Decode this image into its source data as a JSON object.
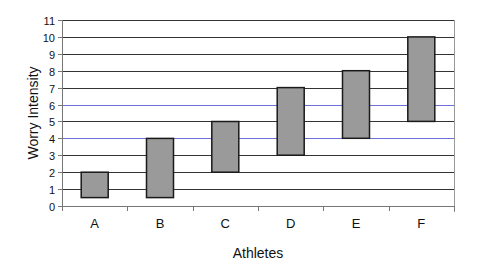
{
  "chart_data": {
    "type": "bar",
    "subtype": "floating-range",
    "title": "",
    "xlabel": "Athletes",
    "ylabel": "Worry Intensity",
    "categories": [
      "A",
      "B",
      "C",
      "D",
      "E",
      "F"
    ],
    "series": [
      {
        "name": "Low",
        "values": [
          0.5,
          0.5,
          2,
          3,
          4,
          5
        ]
      },
      {
        "name": "High",
        "values": [
          2,
          4,
          5,
          7,
          8,
          10
        ]
      }
    ],
    "ylim": [
      0,
      11
    ],
    "yticks": [
      0,
      1,
      2,
      3,
      4,
      5,
      6,
      7,
      8,
      9,
      10,
      11
    ],
    "grid": true,
    "highlighted_gridlines": [
      4,
      6
    ],
    "legend": "none",
    "colors": {
      "bar_fill": "#9a9a9a",
      "bar_stroke": "#1a1a1a",
      "grid": "#333333",
      "grid_highlight": "#6f6fd8",
      "axis": "#777777"
    }
  }
}
